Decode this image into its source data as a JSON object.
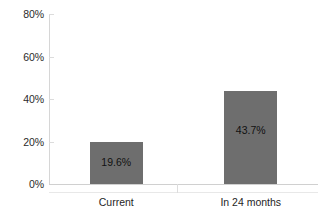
{
  "chart_data": {
    "type": "bar",
    "title": "",
    "subtitle": "",
    "xlabel": "",
    "ylabel": "",
    "categories": [
      "Current",
      "In 24 months"
    ],
    "values": [
      19.6,
      43.7
    ],
    "value_labels": [
      "19.6%",
      "43.7%"
    ],
    "ylim": [
      0,
      80
    ],
    "ytick_values": [
      0,
      20,
      40,
      60,
      80
    ],
    "ytick_labels": [
      "0%",
      "20%",
      "40%",
      "60%",
      "80%"
    ],
    "grid": false,
    "legend": null,
    "legend_position": "none",
    "series": [
      {
        "name": "",
        "values": [
          19.6,
          43.7
        ],
        "color": "#6e6e6e"
      }
    ],
    "colors": {
      "bar": "#6e6e6e",
      "axis": "#d2d2d2",
      "text": "#1a1a1a",
      "background": "#ffffff",
      "data_label": "#111111"
    }
  }
}
